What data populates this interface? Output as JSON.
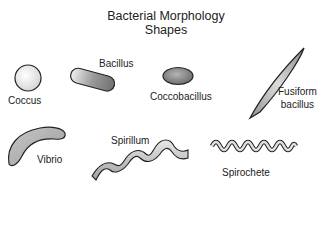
{
  "title": {
    "line1": "Bacterial Morphology",
    "line2": "Shapes"
  },
  "shapes": [
    {
      "id": "coccus",
      "label": "Coccus"
    },
    {
      "id": "bacillus",
      "label": "Bacillus"
    },
    {
      "id": "coccobacillus",
      "label": "Coccobacillus"
    },
    {
      "id": "fusiform",
      "label_line1": "Fusiform",
      "label_line2": "bacillus"
    },
    {
      "id": "vibrio",
      "label": "Vibrio"
    },
    {
      "id": "spirillum",
      "label": "Spirillum"
    },
    {
      "id": "spirochete",
      "label": "Spirochete"
    }
  ],
  "colors": {
    "outline": "#222222",
    "fill_light": "#f2f2f2",
    "fill_mid": "#a8a8a8",
    "fill_dark": "#7a7a7a"
  }
}
